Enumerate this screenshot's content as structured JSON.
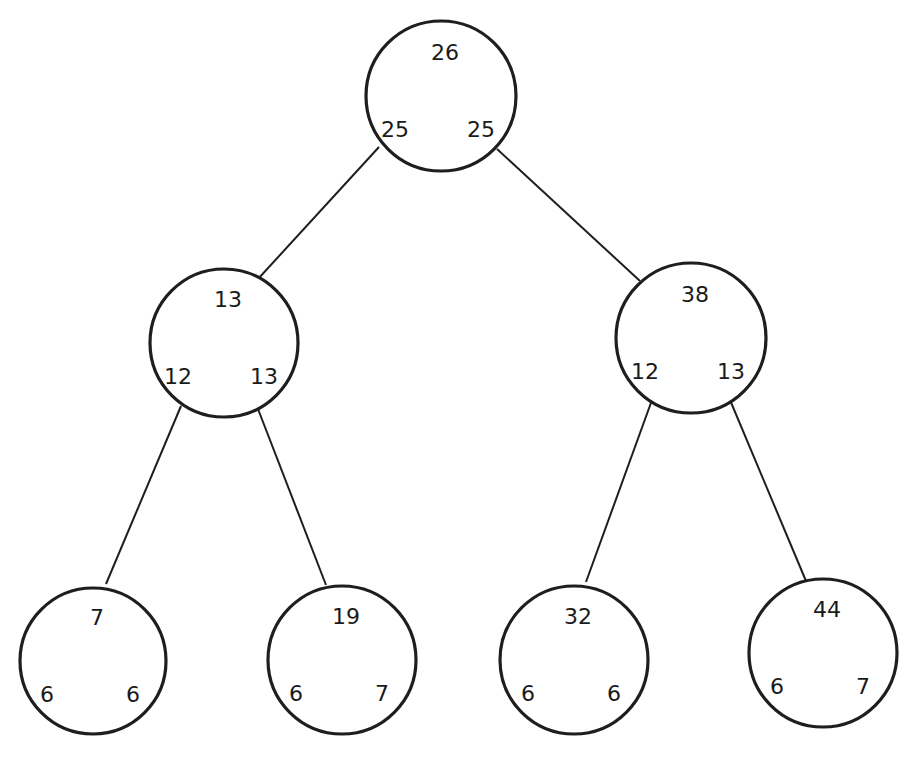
{
  "diagram": {
    "type": "binary-tree",
    "nodes": [
      {
        "id": "root",
        "label": "26",
        "left_count": "25",
        "right_count": "25",
        "cx": 441,
        "cy": 96,
        "r": 75
      },
      {
        "id": "n_l",
        "label": "13",
        "left_count": "12",
        "right_count": "13",
        "cx": 224,
        "cy": 343,
        "r": 74
      },
      {
        "id": "n_r",
        "label": "38",
        "left_count": "12",
        "right_count": "13",
        "cx": 691,
        "cy": 338,
        "r": 75
      },
      {
        "id": "n_ll",
        "label": "7",
        "left_count": "6",
        "right_count": "6",
        "cx": 93,
        "cy": 661,
        "r": 73
      },
      {
        "id": "n_lr",
        "label": "19",
        "left_count": "6",
        "right_count": "7",
        "cx": 342,
        "cy": 660,
        "r": 74
      },
      {
        "id": "n_rl",
        "label": "32",
        "left_count": "6",
        "right_count": "6",
        "cx": 574,
        "cy": 660,
        "r": 74
      },
      {
        "id": "n_rr",
        "label": "44",
        "left_count": "6",
        "right_count": "7",
        "cx": 823,
        "cy": 653,
        "r": 74
      }
    ],
    "edges": [
      {
        "from": "root",
        "to": "n_l",
        "x1": 379,
        "y1": 147,
        "x2": 258,
        "y2": 279
      },
      {
        "from": "root",
        "to": "n_r",
        "x1": 497,
        "y1": 149,
        "x2": 640,
        "y2": 281
      },
      {
        "from": "n_l",
        "to": "n_ll",
        "x1": 181,
        "y1": 406,
        "x2": 106,
        "y2": 584
      },
      {
        "from": "n_l",
        "to": "n_lr",
        "x1": 258,
        "y1": 409,
        "x2": 326,
        "y2": 585
      },
      {
        "from": "n_r",
        "to": "n_rl",
        "x1": 652,
        "y1": 400,
        "x2": 586,
        "y2": 582
      },
      {
        "from": "n_r",
        "to": "n_rr",
        "x1": 730,
        "y1": 400,
        "x2": 806,
        "y2": 581
      }
    ]
  }
}
